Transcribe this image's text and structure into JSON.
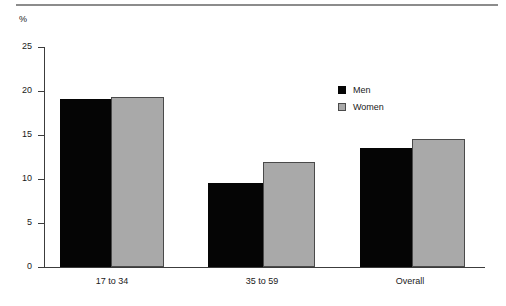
{
  "figure": {
    "unit_label": "%",
    "rule": "horizontal-rule"
  },
  "legend": {
    "position": "inside-top-right",
    "entries": [
      {
        "label": "Men",
        "color": "#050505",
        "swatch": "filled-square"
      },
      {
        "label": "Women",
        "color": "#a9a9a9",
        "swatch": "outlined-square"
      }
    ]
  },
  "axis": {
    "y_ticks": [
      "0",
      "5",
      "10",
      "15",
      "20",
      "25"
    ],
    "x_categories": [
      "17 to 34",
      "35 to 59",
      "Overall"
    ]
  },
  "chart_data": {
    "type": "bar",
    "title": "",
    "xlabel": "",
    "ylabel": "%",
    "categories": [
      "17 to 34",
      "35 to 59",
      "Overall"
    ],
    "series": [
      {
        "name": "Men",
        "color": "#050505",
        "values": [
          19.1,
          9.5,
          13.5
        ]
      },
      {
        "name": "Women",
        "color": "#a9a9a9",
        "values": [
          19.3,
          11.9,
          14.6
        ]
      }
    ],
    "ylim": [
      0,
      25
    ],
    "ytick_step": 5,
    "grid": false,
    "legend_position": "inside-top-right"
  }
}
